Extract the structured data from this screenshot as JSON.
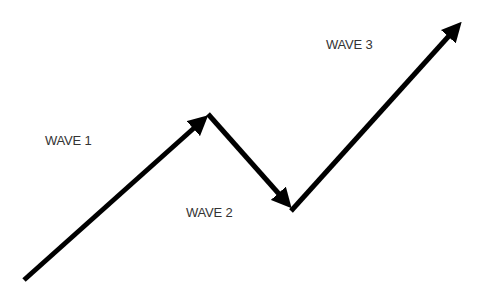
{
  "diagram": {
    "title": "",
    "labels": [
      {
        "id": "wave1",
        "text": "WAVE 1"
      },
      {
        "id": "wave2",
        "text": "WAVE 2"
      },
      {
        "id": "wave3",
        "text": "WAVE 3"
      }
    ],
    "arrows": [
      {
        "id": "wave1",
        "from": [
          24,
          280
        ],
        "to": [
          210,
          114
        ],
        "direction": "up"
      },
      {
        "id": "wave2",
        "from": [
          210,
          114
        ],
        "to": [
          292,
          210
        ],
        "direction": "down"
      },
      {
        "id": "wave3",
        "from": [
          292,
          210
        ],
        "to": [
          465,
          18
        ],
        "direction": "up"
      }
    ],
    "colors": {
      "stroke": "#000000",
      "text": "#333333",
      "background": "#ffffff"
    }
  }
}
